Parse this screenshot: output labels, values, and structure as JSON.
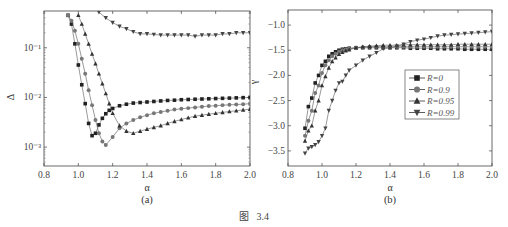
{
  "figure": {
    "caption": "图   3.4"
  },
  "chart_data": [
    {
      "type": "line",
      "panel_label": "(a)",
      "title": "",
      "xlabel": "α",
      "ylabel": "Δ",
      "xlim": [
        0.8,
        2.0
      ],
      "ylim_log10": [
        -3.38,
        -0.26
      ],
      "yscale": "log",
      "xticks": [
        0.8,
        1.0,
        1.2,
        1.4,
        1.6,
        1.8,
        2.0
      ],
      "xtick_labels": [
        "0.8",
        "1.0",
        "1.2",
        "1.4",
        "1.6",
        "1.8",
        "2.0"
      ],
      "yticks": [
        0.1,
        0.01,
        0.001
      ],
      "ytick_labels": [
        "10⁻¹",
        "10⁻²",
        "10⁻³"
      ],
      "grid": false,
      "legend": "none",
      "series": [
        {
          "name": "R=0",
          "marker": "square",
          "x": [
            0.94,
            0.96,
            0.98,
            1.0,
            1.02,
            1.04,
            1.06,
            1.08,
            1.1,
            1.12,
            1.14,
            1.16,
            1.18,
            1.2,
            1.24,
            1.28,
            1.32,
            1.36,
            1.4,
            1.44,
            1.48,
            1.52,
            1.56,
            1.6,
            1.64,
            1.68,
            1.72,
            1.76,
            1.8,
            1.84,
            1.88,
            1.92,
            1.96,
            2.0
          ],
          "y": [
            0.45,
            0.3,
            0.12,
            0.045,
            0.018,
            0.0075,
            0.003,
            0.0017,
            0.0019,
            0.0028,
            0.0038,
            0.0047,
            0.0055,
            0.006,
            0.0068,
            0.0073,
            0.0077,
            0.0079,
            0.0081,
            0.0083,
            0.0085,
            0.0087,
            0.0088,
            0.009,
            0.0091,
            0.0092,
            0.0093,
            0.0094,
            0.0095,
            0.0096,
            0.0097,
            0.0098,
            0.0099,
            0.01
          ]
        },
        {
          "name": "R=0.9",
          "marker": "circle",
          "x": [
            0.94,
            0.96,
            0.98,
            1.0,
            1.02,
            1.04,
            1.06,
            1.08,
            1.1,
            1.12,
            1.14,
            1.16,
            1.2,
            1.24,
            1.28,
            1.32,
            1.36,
            1.4,
            1.44,
            1.48,
            1.52,
            1.56,
            1.6,
            1.64,
            1.68,
            1.72,
            1.76,
            1.8,
            1.84,
            1.88,
            1.92,
            1.96,
            2.0
          ],
          "y": [
            0.45,
            0.35,
            0.22,
            0.12,
            0.06,
            0.03,
            0.014,
            0.007,
            0.0035,
            0.0019,
            0.0013,
            0.0011,
            0.0016,
            0.0024,
            0.003,
            0.0035,
            0.004,
            0.0044,
            0.0048,
            0.0051,
            0.0054,
            0.0057,
            0.0059,
            0.0061,
            0.0063,
            0.0065,
            0.0067,
            0.0068,
            0.007,
            0.0071,
            0.0072,
            0.0073,
            0.0075
          ]
        },
        {
          "name": "R=0.95",
          "marker": "triangle-up",
          "x": [
            1.0,
            1.02,
            1.04,
            1.06,
            1.08,
            1.1,
            1.12,
            1.14,
            1.16,
            1.18,
            1.2,
            1.24,
            1.28,
            1.32,
            1.36,
            1.4,
            1.44,
            1.48,
            1.52,
            1.56,
            1.6,
            1.64,
            1.68,
            1.72,
            1.76,
            1.8,
            1.84,
            1.88,
            1.92,
            1.96,
            2.0
          ],
          "y": [
            0.45,
            0.3,
            0.19,
            0.12,
            0.075,
            0.048,
            0.03,
            0.019,
            0.012,
            0.0075,
            0.0048,
            0.0027,
            0.0021,
            0.0019,
            0.0021,
            0.0023,
            0.0025,
            0.0027,
            0.003,
            0.0033,
            0.0036,
            0.0039,
            0.0042,
            0.0044,
            0.0046,
            0.0048,
            0.005,
            0.0052,
            0.0054,
            0.0056,
            0.0058
          ]
        },
        {
          "name": "R=0.99",
          "marker": "triangle-down",
          "x": [
            1.12,
            1.16,
            1.2,
            1.24,
            1.28,
            1.32,
            1.36,
            1.4,
            1.44,
            1.48,
            1.52,
            1.56,
            1.6,
            1.64,
            1.68,
            1.72,
            1.76,
            1.8,
            1.84,
            1.88,
            1.92,
            1.96,
            2.0
          ],
          "y": [
            0.52,
            0.4,
            0.32,
            0.27,
            0.24,
            0.21,
            0.19,
            0.19,
            0.185,
            0.18,
            0.18,
            0.18,
            0.18,
            0.18,
            0.17,
            0.18,
            0.18,
            0.18,
            0.19,
            0.19,
            0.2,
            0.2,
            0.2
          ]
        }
      ]
    },
    {
      "type": "line",
      "panel_label": "(b)",
      "title": "",
      "xlabel": "α",
      "ylabel": "γ",
      "xlim": [
        0.8,
        2.0
      ],
      "ylim": [
        -3.8,
        -0.7
      ],
      "xticks": [
        0.8,
        1.0,
        1.2,
        1.4,
        1.6,
        1.8,
        2.0
      ],
      "xtick_labels": [
        "0.8",
        "1.0",
        "1.2",
        "1.4",
        "1.6",
        "1.8",
        "2.0"
      ],
      "yticks": [
        -1.0,
        -1.5,
        -2.0,
        -2.5,
        -3.0,
        -3.5
      ],
      "ytick_labels": [
        "−1.0",
        "−1.5",
        "−2.0",
        "−2.5",
        "−3.0",
        "−3.5"
      ],
      "grid": false,
      "legend": "inside right-center",
      "legend_entries": [
        "R=0",
        "R=0.9",
        "R=0.95",
        "R=0.99"
      ],
      "series": [
        {
          "name": "R=0",
          "marker": "square",
          "x": [
            0.9,
            0.92,
            0.94,
            0.96,
            0.98,
            1.0,
            1.02,
            1.04,
            1.06,
            1.08,
            1.1,
            1.12,
            1.14,
            1.16,
            1.2,
            1.24,
            1.28,
            1.32,
            1.36,
            1.4,
            1.44,
            1.48,
            1.52,
            1.56,
            1.6,
            1.64,
            1.68,
            1.72,
            1.76,
            1.8,
            1.84,
            1.88,
            1.92,
            1.96,
            2.0
          ],
          "y": [
            -3.05,
            -2.62,
            -2.45,
            -2.15,
            -2.0,
            -1.8,
            -1.72,
            -1.62,
            -1.57,
            -1.53,
            -1.5,
            -1.48,
            -1.47,
            -1.46,
            -1.45,
            -1.45,
            -1.45,
            -1.45,
            -1.45,
            -1.45,
            -1.45,
            -1.45,
            -1.46,
            -1.46,
            -1.46,
            -1.46,
            -1.47,
            -1.47,
            -1.47,
            -1.47,
            -1.48,
            -1.48,
            -1.48,
            -1.48,
            -1.48
          ]
        },
        {
          "name": "R=0.9",
          "marker": "circle",
          "x": [
            0.9,
            0.92,
            0.94,
            0.96,
            0.98,
            1.0,
            1.02,
            1.04,
            1.06,
            1.08,
            1.1,
            1.12,
            1.14,
            1.16,
            1.2,
            1.24,
            1.28,
            1.32,
            1.36,
            1.4,
            1.44,
            1.48,
            1.52,
            1.56,
            1.6,
            1.64,
            1.68,
            1.72,
            1.76,
            1.8,
            1.84,
            1.88,
            1.92,
            1.96,
            2.0
          ],
          "y": [
            -3.2,
            -2.9,
            -2.7,
            -2.35,
            -2.2,
            -1.95,
            -1.8,
            -1.7,
            -1.62,
            -1.57,
            -1.53,
            -1.5,
            -1.48,
            -1.47,
            -1.45,
            -1.44,
            -1.43,
            -1.43,
            -1.43,
            -1.43,
            -1.43,
            -1.43,
            -1.43,
            -1.43,
            -1.43,
            -1.43,
            -1.43,
            -1.43,
            -1.43,
            -1.43,
            -1.43,
            -1.43,
            -1.43,
            -1.43,
            -1.43
          ]
        },
        {
          "name": "R=0.95",
          "marker": "triangle-up",
          "x": [
            0.9,
            0.92,
            0.94,
            0.96,
            0.98,
            1.0,
            1.02,
            1.04,
            1.06,
            1.08,
            1.1,
            1.12,
            1.14,
            1.16,
            1.2,
            1.24,
            1.28,
            1.32,
            1.36,
            1.4,
            1.44,
            1.48,
            1.52,
            1.56,
            1.6,
            1.64,
            1.68,
            1.72,
            1.76,
            1.8,
            1.84,
            1.88,
            1.92,
            1.96,
            2.0
          ],
          "y": [
            -3.3,
            -3.1,
            -3.0,
            -2.7,
            -2.5,
            -2.2,
            -2.02,
            -1.85,
            -1.72,
            -1.65,
            -1.58,
            -1.54,
            -1.51,
            -1.49,
            -1.45,
            -1.43,
            -1.42,
            -1.41,
            -1.4,
            -1.4,
            -1.4,
            -1.39,
            -1.39,
            -1.39,
            -1.39,
            -1.39,
            -1.39,
            -1.39,
            -1.39,
            -1.38,
            -1.38,
            -1.38,
            -1.38,
            -1.38,
            -1.38
          ]
        },
        {
          "name": "R=0.99",
          "marker": "triangle-down",
          "x": [
            0.9,
            0.92,
            0.94,
            0.96,
            0.98,
            1.0,
            1.02,
            1.04,
            1.06,
            1.08,
            1.1,
            1.12,
            1.14,
            1.16,
            1.2,
            1.24,
            1.28,
            1.32,
            1.36,
            1.4,
            1.44,
            1.48,
            1.52,
            1.56,
            1.6,
            1.64,
            1.68,
            1.72,
            1.76,
            1.8,
            1.84,
            1.88,
            1.92,
            1.96,
            2.0
          ],
          "y": [
            -3.55,
            -3.45,
            -3.42,
            -3.38,
            -3.32,
            -3.2,
            -3.05,
            -2.7,
            -2.5,
            -2.3,
            -2.15,
            -2.12,
            -2.0,
            -1.9,
            -1.8,
            -1.7,
            -1.62,
            -1.55,
            -1.47,
            -1.45,
            -1.42,
            -1.38,
            -1.33,
            -1.3,
            -1.28,
            -1.25,
            -1.22,
            -1.2,
            -1.19,
            -1.18,
            -1.17,
            -1.16,
            -1.15,
            -1.14,
            -1.13
          ]
        }
      ]
    }
  ]
}
